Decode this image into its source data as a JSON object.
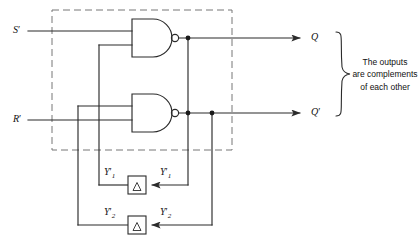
{
  "diagram": {
    "type": "logic-circuit",
    "colors": {
      "wire": "#2b2b2b",
      "dashed_box": "#6f6f6f",
      "text": "#111111",
      "background": "#ffffff"
    }
  },
  "inputs": [
    {
      "id": "s-input",
      "label": "S",
      "prime": "′"
    },
    {
      "id": "r-input",
      "label": "R",
      "prime": "′"
    }
  ],
  "outputs": [
    {
      "id": "q-output",
      "label": "Q",
      "prime": ""
    },
    {
      "id": "qprime-output",
      "label": "Q",
      "prime": "′"
    }
  ],
  "gates": [
    {
      "id": "nand-gate-top",
      "type": "NAND",
      "symbol": "nand-gate-icon"
    },
    {
      "id": "nand-gate-bottom",
      "type": "NAND",
      "symbol": "nand-gate-icon"
    }
  ],
  "delays": [
    {
      "id": "delay-element-1",
      "symbol": "△",
      "name": "delta-triangle-icon"
    },
    {
      "id": "delay-element-2",
      "symbol": "△",
      "name": "delta-triangle-icon"
    }
  ],
  "feedback_labels": [
    {
      "id": "y1-out",
      "base": "Y",
      "sub": "1",
      "star": "′"
    },
    {
      "id": "y1-in",
      "base": "Y",
      "sub": "1",
      "star": "′"
    },
    {
      "id": "y2-out",
      "base": "Y",
      "sub": "2",
      "star": "′"
    },
    {
      "id": "y2-in",
      "base": "Y",
      "sub": "2",
      "star": "′"
    }
  ],
  "annotation": {
    "text": "The outputs\nare complements\nof each other",
    "brace": "right-curly-brace"
  }
}
